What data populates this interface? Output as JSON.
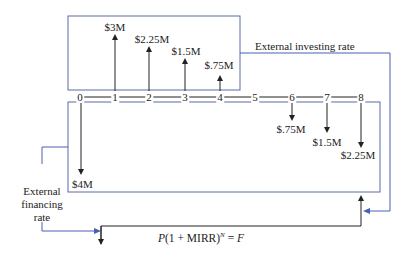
{
  "diagram": {
    "colors": {
      "box_line": "#5a6aa8",
      "flow_line": "#4a5fb5",
      "arrow_line": "#222222"
    },
    "timeline": {
      "periods": [
        "0",
        "1",
        "2",
        "3",
        "4",
        "5",
        "6",
        "7",
        "8"
      ]
    },
    "inflows": [
      {
        "period": "1",
        "label": "$3M"
      },
      {
        "period": "2",
        "label": "$2.25M"
      },
      {
        "period": "3",
        "label": "$1.5M"
      },
      {
        "period": "4",
        "label": "$.75M"
      }
    ],
    "outflows": [
      {
        "period": "0",
        "label": "$4M"
      },
      {
        "period": "6",
        "label": "$.75M"
      },
      {
        "period": "7",
        "label": "$1.5M"
      },
      {
        "period": "8",
        "label": "$2.25M"
      }
    ],
    "labels": {
      "investing_rate": "External investing rate",
      "financing_rate_line1": "External",
      "financing_rate_line2": "financing",
      "financing_rate_line3": "rate"
    },
    "formula": {
      "P": "P",
      "mid": "(1 + MIRR)",
      "exp": "N",
      "eq": " = ",
      "F": "F"
    }
  }
}
